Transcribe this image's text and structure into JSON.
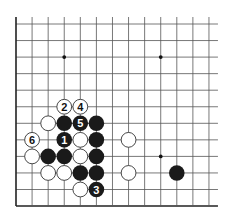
{
  "board": {
    "description": "Go board fragment (lower-left region), 13 columns x 12 rows visible",
    "columns": 13,
    "rows": 12,
    "origin_x": 16,
    "origin_y": 24,
    "spacing_x": 16.08,
    "spacing_y": 16.55,
    "left_edge": true,
    "bottom_edge": true,
    "top_edge": false,
    "right_edge": false,
    "line_color": "#555555",
    "edge_color": "#222222",
    "stone_radius": 7.8,
    "black_color": "#1a1a1a",
    "white_fill": "#ffffff",
    "white_stroke": "#333333",
    "star_points": [
      {
        "col": 3,
        "row": 2
      },
      {
        "col": 9,
        "row": 2
      },
      {
        "col": 9,
        "row": 8
      }
    ],
    "stones": [
      {
        "color": "white",
        "col": 3,
        "row": 5,
        "label": "2"
      },
      {
        "color": "white",
        "col": 4,
        "row": 5,
        "label": "4"
      },
      {
        "color": "white",
        "col": 2,
        "row": 6,
        "label": ""
      },
      {
        "color": "black",
        "col": 3,
        "row": 6,
        "label": ""
      },
      {
        "color": "black",
        "col": 4,
        "row": 6,
        "label": "5"
      },
      {
        "color": "black",
        "col": 5,
        "row": 6,
        "label": ""
      },
      {
        "color": "white",
        "col": 1,
        "row": 7,
        "label": "6"
      },
      {
        "color": "black",
        "col": 3,
        "row": 7,
        "label": "1"
      },
      {
        "color": "white",
        "col": 4,
        "row": 7,
        "label": ""
      },
      {
        "color": "black",
        "col": 5,
        "row": 7,
        "label": ""
      },
      {
        "color": "white",
        "col": 7,
        "row": 7,
        "label": ""
      },
      {
        "color": "white",
        "col": 1,
        "row": 8,
        "label": ""
      },
      {
        "color": "black",
        "col": 2,
        "row": 8,
        "label": ""
      },
      {
        "color": "black",
        "col": 3,
        "row": 8,
        "label": ""
      },
      {
        "color": "white",
        "col": 4,
        "row": 8,
        "label": ""
      },
      {
        "color": "black",
        "col": 5,
        "row": 8,
        "label": ""
      },
      {
        "color": "white",
        "col": 2,
        "row": 9,
        "label": ""
      },
      {
        "color": "white",
        "col": 3,
        "row": 9,
        "label": ""
      },
      {
        "color": "black",
        "col": 4,
        "row": 9,
        "label": ""
      },
      {
        "color": "black",
        "col": 5,
        "row": 9,
        "label": ""
      },
      {
        "color": "white",
        "col": 7,
        "row": 9,
        "label": ""
      },
      {
        "color": "black",
        "col": 10,
        "row": 9,
        "label": ""
      },
      {
        "color": "white",
        "col": 4,
        "row": 10,
        "label": ""
      },
      {
        "color": "black",
        "col": 5,
        "row": 10,
        "label": "3"
      }
    ]
  }
}
